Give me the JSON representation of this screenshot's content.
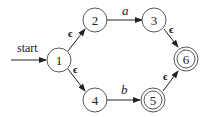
{
  "diagram": {
    "type": "nfa",
    "start_label": "start",
    "start_state": "1",
    "states": [
      {
        "id": "1",
        "label": "1",
        "accepting": false
      },
      {
        "id": "2",
        "label": "2",
        "accepting": false
      },
      {
        "id": "3",
        "label": "3",
        "accepting": false
      },
      {
        "id": "4",
        "label": "4",
        "accepting": false
      },
      {
        "id": "5",
        "label": "5",
        "accepting": true
      },
      {
        "id": "6",
        "label": "6",
        "accepting": true
      }
    ],
    "transitions": [
      {
        "from": "1",
        "to": "2",
        "label": "ϵ"
      },
      {
        "from": "1",
        "to": "4",
        "label": "ϵ"
      },
      {
        "from": "2",
        "to": "3",
        "label": "a"
      },
      {
        "from": "4",
        "to": "5",
        "label": "b"
      },
      {
        "from": "3",
        "to": "6",
        "label": "ϵ"
      },
      {
        "from": "5",
        "to": "6",
        "label": "ϵ"
      }
    ]
  }
}
